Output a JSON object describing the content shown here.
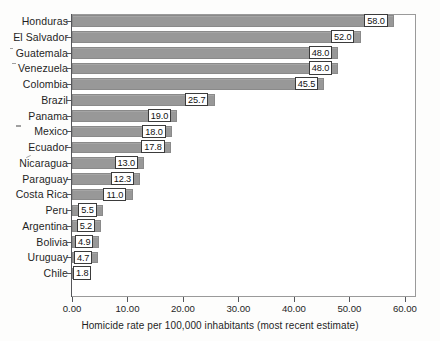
{
  "chart_data": {
    "type": "bar",
    "orientation": "horizontal",
    "title": "",
    "xlabel": "Homicide rate per 100,000 inhabitants (most recent estimate)",
    "ylabel": "",
    "xlim": [
      0.0,
      62.0
    ],
    "xticks": [
      "0.00",
      "10.00",
      "20.00",
      "30.00",
      "40.00",
      "50.00",
      "60.00"
    ],
    "xtick_values": [
      0,
      10,
      20,
      30,
      40,
      50,
      60
    ],
    "grid": false,
    "legend": "none",
    "bar_color": "#9b9b9b",
    "bar_edge_color": "#8a8a8a",
    "label_box_border": "#3b3b3b",
    "label_box_fill": "#ffffff",
    "categories": [
      "Honduras",
      "El Salvador",
      "Guatemala",
      "Venezuela",
      "Colombia",
      "Brazil",
      "Panama",
      "Mexico",
      "Ecuador",
      "Nicaragua",
      "Paraguay",
      "Costa Rica",
      "Peru",
      "Argentina",
      "Bolivia",
      "Uruguay",
      "Chile"
    ],
    "values": [
      58.0,
      52.0,
      48.0,
      48.0,
      45.5,
      25.7,
      19.0,
      18.0,
      17.8,
      13.0,
      12.3,
      11.0,
      5.5,
      5.2,
      4.9,
      4.7,
      1.8
    ],
    "value_labels": [
      "58.0",
      "52.0",
      "48.0",
      "48.0",
      "45.5",
      "25.7",
      "19.0",
      "18.0",
      "17.8",
      "13.0",
      "12.3",
      "11.0",
      "5.5",
      "5.2",
      "4.9",
      "4.7",
      "1.8"
    ]
  }
}
